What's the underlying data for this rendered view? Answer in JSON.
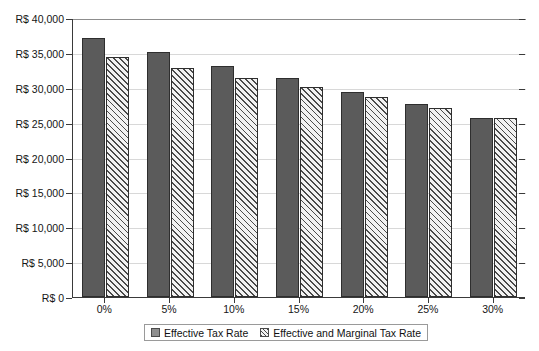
{
  "chart_data": {
    "type": "bar",
    "title": "",
    "xlabel": "",
    "ylabel": "",
    "categories": [
      "0%",
      "5%",
      "10%",
      "15%",
      "20%",
      "25%",
      "30%"
    ],
    "series": [
      {
        "name": "Effective Tax Rate",
        "color": "#5b5b5b",
        "values": [
          37130,
          35160,
          33100,
          31450,
          29450,
          27700,
          25650
        ]
      },
      {
        "name": "Effective and Marginal Tax Rate",
        "color": "#ededed",
        "values": [
          34400,
          32900,
          31400,
          30050,
          28700,
          27150,
          25650
        ]
      }
    ],
    "ylim": [
      0,
      40000
    ],
    "ytick_values": [
      0,
      5000,
      10000,
      15000,
      20000,
      25000,
      30000,
      35000,
      40000
    ],
    "ytick_labels": [
      "R$ 0",
      "R$ 5,000",
      "R$ 10,000",
      "R$ 15,000",
      "R$ 20,000",
      "R$ 25,000",
      "R$ 30,000",
      "R$ 35,000",
      "R$ 40,000"
    ],
    "grid": true,
    "legend_position": "bottom",
    "currency_prefix": "R$"
  }
}
